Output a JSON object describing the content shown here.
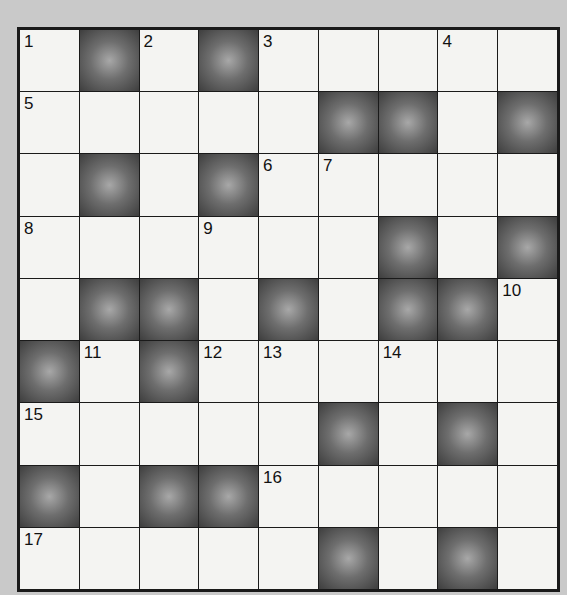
{
  "puzzle": {
    "type": "crossword",
    "rows": 9,
    "cols": 9,
    "colors": {
      "black_cell": "#555555",
      "white_cell": "#f4f4f2",
      "border": "#1a1a1a",
      "background": "#c9c9c9"
    },
    "grid": [
      [
        {
          "n": "1"
        },
        {
          "b": true
        },
        {
          "n": "2"
        },
        {
          "b": true
        },
        {
          "n": "3"
        },
        {},
        {},
        {
          "n": "4"
        },
        {}
      ],
      [
        {
          "n": "5"
        },
        {},
        {},
        {},
        {},
        {
          "b": true
        },
        {
          "b": true
        },
        {},
        {
          "b": true
        }
      ],
      [
        {},
        {
          "b": true
        },
        {},
        {
          "b": true
        },
        {
          "n": "6"
        },
        {
          "n": "7"
        },
        {},
        {},
        {}
      ],
      [
        {
          "n": "8"
        },
        {},
        {},
        {
          "n": "9"
        },
        {},
        {},
        {
          "b": true
        },
        {},
        {
          "b": true
        }
      ],
      [
        {},
        {
          "b": true
        },
        {
          "b": true
        },
        {},
        {
          "b": true
        },
        {},
        {
          "b": true
        },
        {
          "b": true
        },
        {
          "n": "10"
        }
      ],
      [
        {
          "b": true
        },
        {
          "n": "11"
        },
        {
          "b": true
        },
        {
          "n": "12"
        },
        {
          "n": "13"
        },
        {},
        {
          "n": "14"
        },
        {},
        {}
      ],
      [
        {
          "n": "15"
        },
        {},
        {},
        {},
        {},
        {
          "b": true
        },
        {},
        {
          "b": true
        },
        {}
      ],
      [
        {
          "b": true
        },
        {},
        {
          "b": true
        },
        {
          "b": true
        },
        {
          "n": "16"
        },
        {},
        {},
        {},
        {}
      ],
      [
        {
          "n": "17"
        },
        {},
        {},
        {},
        {},
        {
          "b": true
        },
        {},
        {
          "b": true
        },
        {}
      ]
    ]
  }
}
